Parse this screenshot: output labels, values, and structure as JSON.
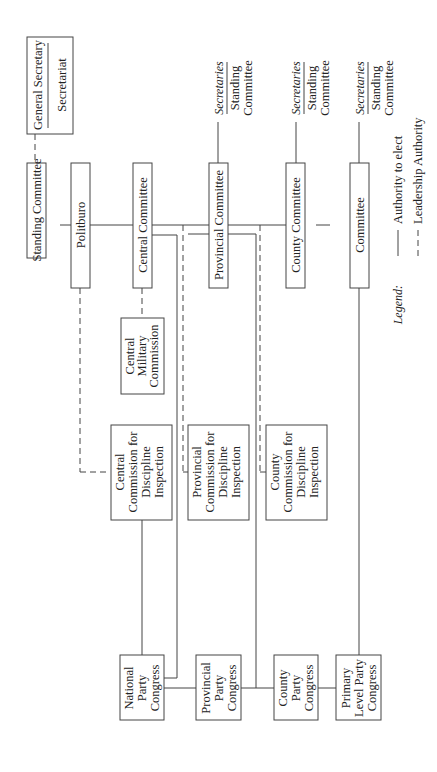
{
  "diagram": {
    "orientation": "rotated-90-ccw",
    "nodes": {
      "general_secretary": "General Secretary",
      "secretariat": "Secretariat",
      "standing_committee": "Standing Committee",
      "politburo": "Politburo",
      "central_committee": "Central Committee",
      "provincial_committee": "Provincial Committee",
      "county_committee": "County Committee",
      "committee": "Committee",
      "central_military_commission": [
        "Central",
        "Military",
        "Commission"
      ],
      "central_cdi": [
        "Central",
        "Commission for",
        "Discipline",
        "Inspection"
      ],
      "provincial_cdi": [
        "Provincial",
        "Commission for",
        "Discipline",
        "Inspection"
      ],
      "county_cdi": [
        "County",
        "Commission for",
        "Discipline",
        "Inspection"
      ],
      "national_party_congress": [
        "National",
        "Party",
        "Congress"
      ],
      "provincial_party_congress": [
        "Provincial",
        "Party",
        "Congress"
      ],
      "county_party_congress": [
        "County",
        "Party",
        "Congress"
      ],
      "primary_level_party_congress": [
        "Primary",
        "Level Party",
        "Congress"
      ]
    },
    "side_notes": [
      {
        "level": "provincial",
        "top": "Secretaries",
        "bottom": [
          "Standing",
          "Committee"
        ]
      },
      {
        "level": "county",
        "top": "Secretaries",
        "bottom": [
          "Standing",
          "Committee"
        ]
      },
      {
        "level": "primary",
        "top": "Secretaries",
        "bottom": [
          "Standing",
          "Committee"
        ]
      }
    ],
    "legend": {
      "title": "Legend:",
      "items": [
        {
          "style": "solid",
          "label": "Authority to elect"
        },
        {
          "style": "dashed",
          "label": "Leadership Authority"
        }
      ]
    }
  }
}
